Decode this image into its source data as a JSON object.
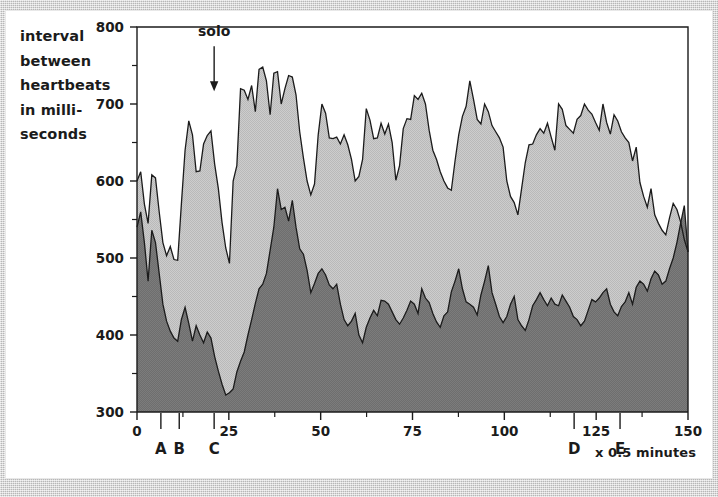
{
  "figure": {
    "y_axis_title_lines": [
      "interval",
      "between",
      "heartbeats",
      "in milli-",
      "seconds"
    ],
    "x_unit_label": "x 0.5 minutes"
  },
  "chart_data": {
    "type": "area",
    "title": "",
    "xlabel": "x 0.5 minutes",
    "ylabel": "interval between heartbeats in milliseconds",
    "xlim": [
      0,
      150
    ],
    "ylim": [
      300,
      800
    ],
    "grid": false,
    "legend_position": "none",
    "x_ticks": [
      0,
      25,
      50,
      75,
      100,
      125,
      150
    ],
    "x_minor_tick_step": 12.5,
    "y_ticks": [
      300,
      400,
      500,
      600,
      700,
      800
    ],
    "y_minor_tick_step": 50,
    "colors": {
      "upper_band_fill": "#b9b9b9",
      "lower_band_fill": "#7c7c7c",
      "line": "#1b1b1b",
      "axis": "#1b1b1b",
      "background": "#ffffff"
    },
    "annotations": [
      {
        "name": "solo",
        "text": "solo",
        "x": 21,
        "arrow_from_y": 775,
        "arrow_to_y": 718
      }
    ],
    "event_markers": [
      {
        "label": "A",
        "x": 6.5
      },
      {
        "label": "B",
        "x": 11.5
      },
      {
        "label": "C",
        "x": 21.0
      },
      {
        "label": "D",
        "x": 119.0
      },
      {
        "label": "E",
        "x": 131.5
      }
    ],
    "series": [
      {
        "name": "maximum interval",
        "fill": "#b9b9b9",
        "values": [
          600,
          612,
          570,
          545,
          608,
          604,
          560,
          520,
          503,
          515,
          498,
          497,
          570,
          640,
          678,
          660,
          612,
          613,
          648,
          659,
          665,
          622,
          590,
          546,
          513,
          493,
          600,
          620,
          720,
          718,
          706,
          724,
          690,
          745,
          748,
          730,
          686,
          740,
          742,
          700,
          720,
          737,
          735,
          712,
          664,
          630,
          600,
          582,
          596,
          660,
          700,
          688,
          656,
          655,
          657,
          648,
          660,
          647,
          628,
          600,
          606,
          628,
          694,
          679,
          655,
          656,
          675,
          661,
          674,
          650,
          601,
          620,
          668,
          681,
          680,
          711,
          706,
          714,
          700,
          666,
          640,
          628,
          612,
          600,
          591,
          588,
          626,
          660,
          684,
          697,
          730,
          706,
          680,
          674,
          700,
          690,
          672,
          664,
          656,
          644,
          600,
          580,
          572,
          556,
          590,
          624,
          647,
          648,
          660,
          668,
          662,
          675,
          657,
          640,
          700,
          693,
          672,
          667,
          662,
          680,
          685,
          700,
          692,
          687,
          676,
          666,
          700,
          676,
          661,
          686,
          678,
          664,
          656,
          650,
          626,
          644,
          598,
          580,
          566,
          590,
          556,
          545,
          536,
          530,
          552,
          571,
          563,
          547,
          524,
          508
        ]
      },
      {
        "name": "minimum interval",
        "fill": "#7c7c7c",
        "values": [
          540,
          560,
          520,
          470,
          536,
          520,
          480,
          440,
          418,
          405,
          396,
          392,
          420,
          436,
          415,
          392,
          412,
          400,
          390,
          404,
          396,
          372,
          353,
          336,
          322,
          325,
          330,
          352,
          366,
          378,
          400,
          420,
          441,
          460,
          466,
          480,
          510,
          540,
          590,
          563,
          566,
          548,
          575,
          540,
          512,
          505,
          484,
          455,
          467,
          480,
          486,
          478,
          465,
          460,
          466,
          440,
          420,
          412,
          418,
          428,
          400,
          390,
          410,
          422,
          432,
          425,
          445,
          444,
          440,
          430,
          420,
          414,
          422,
          432,
          444,
          440,
          428,
          460,
          448,
          442,
          428,
          417,
          410,
          425,
          430,
          456,
          470,
          486,
          460,
          443,
          440,
          436,
          426,
          452,
          470,
          490,
          455,
          440,
          424,
          416,
          424,
          440,
          450,
          420,
          412,
          406,
          420,
          438,
          446,
          455,
          446,
          438,
          448,
          440,
          438,
          452,
          444,
          436,
          424,
          420,
          412,
          418,
          432,
          446,
          443,
          448,
          455,
          460,
          440,
          430,
          425,
          437,
          443,
          455,
          440,
          462,
          470,
          466,
          457,
          473,
          483,
          478,
          466,
          470,
          486,
          500,
          520,
          545,
          568,
          508
        ]
      }
    ]
  }
}
